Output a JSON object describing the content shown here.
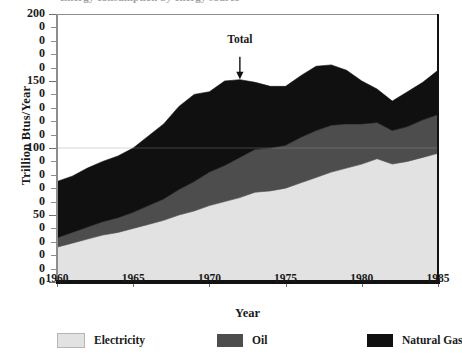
{
  "caption": {
    "clipped_text": "Energy consumption by energy source"
  },
  "chart_data": {
    "type": "area",
    "stacked": true,
    "title": "",
    "xlabel": "Year",
    "ylabel": "Trillion Btus/Year",
    "xlim": [
      1960,
      1985
    ],
    "ylim": [
      0,
      200
    ],
    "grid": false,
    "legend_position": "bottom",
    "x_ticks_major": [
      1960,
      1965,
      1970,
      1975,
      1980,
      1985
    ],
    "x_tick_labels": [
      "1960",
      "1965",
      "1970",
      "1975",
      "1980",
      "1985"
    ],
    "y_ticks_major": [
      0,
      50,
      100,
      150,
      200
    ],
    "y_tick_step": 10,
    "y_tick_labels": [
      "200",
      "0",
      "0",
      "0",
      "0",
      "150",
      "0",
      "0",
      "0",
      "0",
      "100",
      "0",
      "0",
      "0",
      "0",
      "50",
      "0",
      "0",
      "0",
      "0",
      "0"
    ],
    "y_tick_labels_note": "Intermediate labels are clipped at the left image edge; only the final digit 0 is visible.",
    "x": [
      1960,
      1961,
      1962,
      1963,
      1964,
      1965,
      1966,
      1967,
      1968,
      1969,
      1970,
      1971,
      1972,
      1973,
      1974,
      1975,
      1976,
      1977,
      1978,
      1979,
      1980,
      1981,
      1982,
      1983,
      1984,
      1985
    ],
    "series": [
      {
        "name": "Electricity",
        "color": "#e2e2e2",
        "values": [
          26,
          29,
          32,
          35,
          37,
          40,
          43,
          46,
          50,
          53,
          57,
          60,
          63,
          67,
          68,
          70,
          74,
          78,
          82,
          85,
          88,
          92,
          88,
          90,
          93,
          96
        ]
      },
      {
        "name": "Oil",
        "color": "#4d4d4d",
        "values": [
          7,
          8,
          9,
          10,
          11,
          12,
          14,
          16,
          19,
          22,
          25,
          27,
          30,
          32,
          32,
          32,
          34,
          35,
          35,
          33,
          30,
          27,
          25,
          26,
          28,
          29
        ]
      },
      {
        "name": "Natural Gas",
        "color": "#101010",
        "values": [
          42,
          42,
          44,
          45,
          46,
          48,
          52,
          56,
          62,
          65,
          60,
          63,
          58,
          50,
          46,
          44,
          46,
          48,
          45,
          40,
          32,
          25,
          22,
          26,
          28,
          33
        ]
      }
    ],
    "total": {
      "name": "Total",
      "values": [
        75,
        79,
        85,
        90,
        94,
        100,
        109,
        118,
        131,
        140,
        142,
        150,
        151,
        149,
        146,
        146,
        154,
        161,
        162,
        158,
        150,
        144,
        135,
        142,
        149,
        158
      ]
    },
    "annotations": [
      {
        "name": "total-annotation",
        "label": "Total",
        "points_to_year": 1972,
        "points_to_value": 151
      }
    ],
    "legend": [
      {
        "label": "Electricity",
        "color": "#e2e2e2"
      },
      {
        "label": "Oil",
        "color": "#4d4d4d"
      },
      {
        "label": "Natural Gas",
        "color": "#101010"
      }
    ]
  }
}
